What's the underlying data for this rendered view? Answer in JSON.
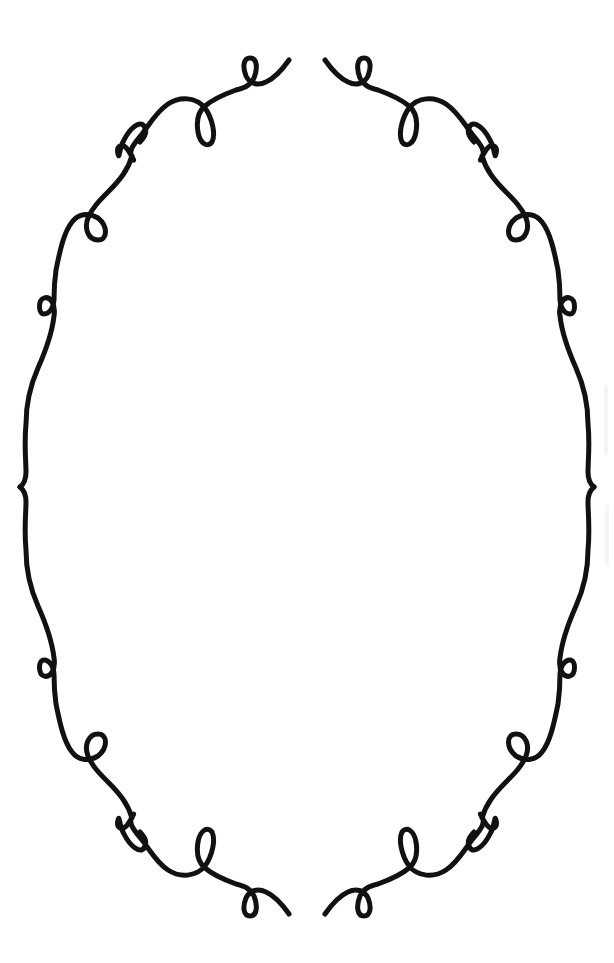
{
  "artwork": {
    "description": "Decorative oval ornamental frame with loop flourishes",
    "stroke_color": "#111111",
    "background_color": "#ffffff",
    "stroke_width": 5,
    "symmetry": "horizontal and vertical mirror"
  }
}
